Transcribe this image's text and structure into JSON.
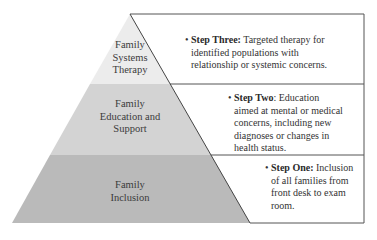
{
  "pyramid": {
    "tiers": [
      {
        "label_lines": [
          "Family",
          "Systems",
          "Therapy"
        ],
        "fill": "#ececec"
      },
      {
        "label_lines": [
          "Family",
          "Education and",
          "Support"
        ],
        "fill": "#d2d2d2"
      },
      {
        "label_lines": [
          "Family",
          "Inclusion"
        ],
        "fill": "#b9b9b9"
      }
    ]
  },
  "steps": [
    {
      "bullet": "•",
      "title": "Step Three:",
      "lines": [
        " Targeted therapy for",
        "identified populations with",
        "relationship or systemic concerns."
      ]
    },
    {
      "bullet": "•",
      "title": "Step Two",
      "lines": [
        ": Education",
        "aimed at mental or medical",
        "concerns, including new",
        "diagnoses or changes in",
        "health status."
      ]
    },
    {
      "bullet": "•",
      "title": "Step One:",
      "lines": [
        " Inclusion",
        "of all families from",
        "front desk to exam",
        "room."
      ]
    }
  ],
  "colors": {
    "line": "#555555",
    "tier_top": "#ececec",
    "tier_middle": "#d2d2d2",
    "tier_bottom": "#b9b9b9"
  }
}
